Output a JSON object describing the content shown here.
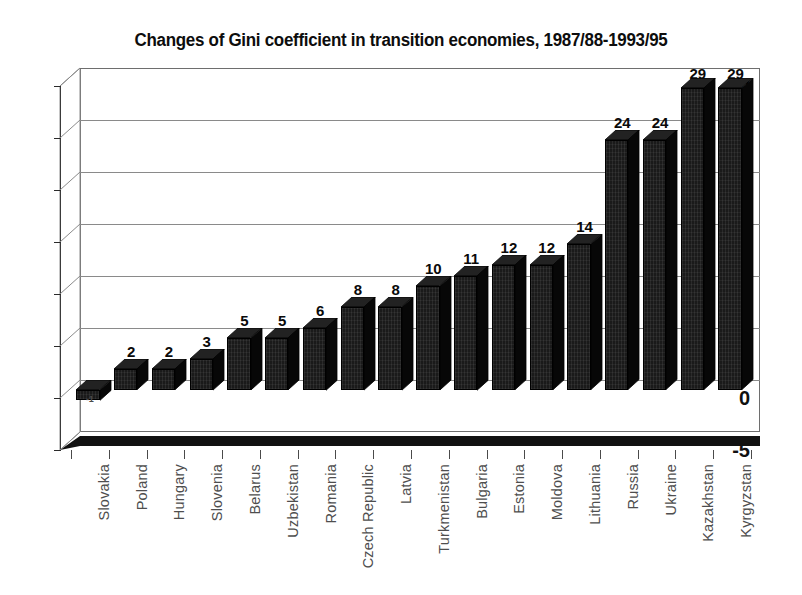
{
  "chart_data": {
    "type": "bar",
    "title": "Changes of Gini coefficient in transition economies, 1987/88-1993/95",
    "xlabel": "",
    "ylabel": "",
    "ylim": [
      -5,
      30
    ],
    "yticks": [
      30,
      25,
      20,
      15,
      10,
      5,
      0,
      -5
    ],
    "grid": true,
    "legend": "none",
    "orientation": "vertical",
    "style": "3d-column",
    "categories": [
      "Slovakia",
      "Poland",
      "Hungary",
      "Slovenia",
      "Belarus",
      "Uzbekistan",
      "Romania",
      "Czech Republic",
      "Latvia",
      "Turkmenistan",
      "Bulgaria",
      "Estonia",
      "Moldova",
      "Lithuania",
      "Russia",
      "Ukraine",
      "Kazakhstan",
      "Kyrgyzstan"
    ],
    "values": [
      -1,
      2,
      2,
      3,
      5,
      5,
      6,
      8,
      8,
      10,
      11,
      12,
      12,
      14,
      24,
      24,
      29,
      29
    ],
    "value_labels": [
      "-1",
      "2",
      "2",
      "3",
      "5",
      "5",
      "6",
      "8",
      "8",
      "10",
      "11",
      "12",
      "12",
      "14",
      "24",
      "24",
      "29",
      "29"
    ],
    "bar_color": "#1a1a1a",
    "grid_color": "#8a8a8a",
    "text_color": "#4e4e4e"
  }
}
